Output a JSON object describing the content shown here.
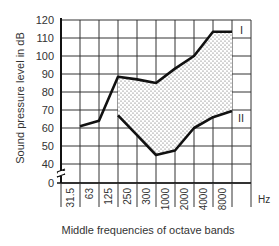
{
  "chart_data": {
    "type": "line",
    "title": "",
    "xlabel": "Middle frequencies of octave bands",
    "xunit": "Hz",
    "ylabel": "Sound pressure level in dB",
    "categories": [
      "31.5",
      "63",
      "125",
      "250",
      "300",
      "1000",
      "2000",
      "4000",
      "8000"
    ],
    "yticks": [
      0,
      40,
      50,
      60,
      70,
      80,
      90,
      100,
      110,
      120
    ],
    "ylim": [
      0,
      120
    ],
    "axis_break": "between 0 and 40",
    "grid": true,
    "series": [
      {
        "name": "I",
        "values": [
          61,
          64,
          88.5,
          87,
          85,
          93,
          100,
          113.5,
          113.5
        ]
      },
      {
        "name": "II",
        "values": [
          null,
          null,
          67,
          56,
          45,
          47.5,
          60,
          66,
          69.5
        ]
      }
    ],
    "fill_between": {
      "series": [
        "I",
        "II"
      ],
      "pattern": "dotted",
      "from": "125",
      "to": "8000"
    },
    "annotations": [
      {
        "text": "I",
        "near": "series I end"
      },
      {
        "text": "II",
        "near": "series II end"
      }
    ]
  }
}
